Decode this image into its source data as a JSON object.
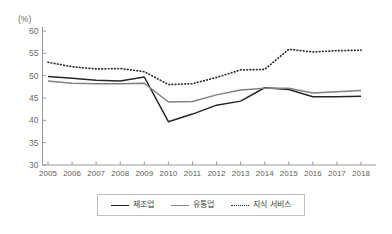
{
  "chart_data": {
    "type": "line",
    "title": "",
    "xlabel": "",
    "ylabel": "",
    "unit_label": "(%)",
    "grid": false,
    "legend_position": "bottom",
    "ylim": [
      30,
      60
    ],
    "yticks": [
      30,
      35,
      40,
      45,
      50,
      55,
      60
    ],
    "categories": [
      "2005",
      "2006",
      "2007",
      "2008",
      "2009",
      "2010",
      "2011",
      "2012",
      "2013",
      "2014",
      "2015",
      "2016",
      "2017",
      "2018"
    ],
    "series": [
      {
        "name": "제조업",
        "style": "solid",
        "color": "#262626",
        "values": [
          49.8,
          49.4,
          49.0,
          48.8,
          49.7,
          39.7,
          41.4,
          43.4,
          44.3,
          47.3,
          46.9,
          45.3,
          45.3,
          45.4
        ]
      },
      {
        "name": "유통업",
        "style": "solid",
        "color": "#808080",
        "values": [
          48.8,
          48.3,
          48.2,
          48.2,
          48.3,
          44.1,
          44.2,
          45.7,
          46.8,
          47.2,
          47.2,
          46.1,
          46.4,
          46.7
        ]
      },
      {
        "name": "지식 서비스",
        "style": "dotted",
        "color": "#2b2b2b",
        "values": [
          53.0,
          52.0,
          51.5,
          51.6,
          50.9,
          48.0,
          48.2,
          49.6,
          51.3,
          51.4,
          55.9,
          55.3,
          55.6,
          55.7
        ]
      }
    ]
  },
  "legend": {
    "items": [
      {
        "label": "제조업",
        "color": "#262626",
        "style": "solid"
      },
      {
        "label": "유통업",
        "color": "#808080",
        "style": "solid"
      },
      {
        "label": "지식 서비스",
        "color": "#2b2b2b",
        "style": "dotted"
      }
    ]
  }
}
